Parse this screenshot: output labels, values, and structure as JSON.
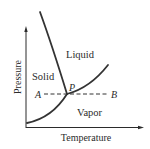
{
  "diagram": {
    "type": "phase-diagram",
    "x_axis": {
      "label": "Temperature"
    },
    "y_axis": {
      "label": "Pressure"
    },
    "regions": [
      {
        "id": "solid",
        "label": "Solid"
      },
      {
        "id": "liquid",
        "label": "Liquid"
      },
      {
        "id": "vapor",
        "label": "Vapor"
      }
    ],
    "points": {
      "triple_point": "P",
      "start": "A",
      "end": "B"
    },
    "curves": [
      {
        "id": "fusion-curve",
        "between": [
          "Solid",
          "Liquid"
        ]
      },
      {
        "id": "vaporization-curve",
        "between": [
          "Liquid",
          "Vapor"
        ]
      },
      {
        "id": "sublimation-curve",
        "between": [
          "Solid",
          "Vapor"
        ]
      }
    ],
    "path": {
      "id": "isobar-A-B",
      "from": "A",
      "to": "B",
      "style": "dashed",
      "through": "P"
    },
    "colors": {
      "line": "#2b2b2b",
      "background": "#ffffff"
    }
  }
}
